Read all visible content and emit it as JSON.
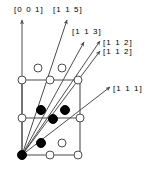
{
  "figure": {
    "type": "crystal-lattice-direction-diagram",
    "colors": {
      "line": "#4d4d4d",
      "vector": "#4d4d4d",
      "filled_atom": "#000000",
      "open_atom_fill": "#ffffff",
      "open_atom_stroke": "#4d4d4d",
      "text": "#000000",
      "background": "#ffffff"
    },
    "labels": [
      {
        "id": "dir-001",
        "text": "[0 0 1]",
        "x": 14,
        "y": 5
      },
      {
        "id": "dir-115",
        "text": "[1 1 5]",
        "x": 53,
        "y": 5
      },
      {
        "id": "dir-113",
        "text": "[1 1 3]",
        "x": 72,
        "y": 27
      },
      {
        "id": "dir-112-a",
        "text": "[1 1 2]",
        "x": 103,
        "y": 38
      },
      {
        "id": "dir-112-b",
        "text": "[1 1 2]",
        "x": 103,
        "y": 47
      },
      {
        "id": "dir-111",
        "text": "[1 1 1]",
        "x": 113,
        "y": 84
      }
    ],
    "vectors": [
      {
        "id": "v-001",
        "label": "[0 0 1]",
        "x1": 22,
        "y1": 155,
        "x2": 22,
        "y2": 20
      },
      {
        "id": "v-115",
        "label": "[1 1 5]",
        "x1": 22,
        "y1": 155,
        "x2": 67,
        "y2": 20
      },
      {
        "id": "v-113",
        "label": "[1 1 3]",
        "x1": 22,
        "y1": 155,
        "x2": 84,
        "y2": 42
      },
      {
        "id": "v-112-a",
        "label": "[1 1 2]",
        "x1": 22,
        "y1": 155,
        "x2": 100,
        "y2": 41
      },
      {
        "id": "v-112-b",
        "label": "[1 1 2]",
        "x1": 22,
        "y1": 155,
        "x2": 100,
        "y2": 51
      },
      {
        "id": "v-111",
        "label": "[1 1 1]",
        "x1": 22,
        "y1": 155,
        "x2": 110,
        "y2": 87
      }
    ],
    "cell_lines": [
      {
        "id": "edge-left",
        "x1": 22,
        "y1": 80,
        "x2": 22,
        "y2": 155
      },
      {
        "id": "edge-right",
        "x1": 80,
        "y1": 80,
        "x2": 80,
        "y2": 155
      },
      {
        "id": "edge-top",
        "x1": 22,
        "y1": 80,
        "x2": 80,
        "y2": 80
      },
      {
        "id": "edge-middle",
        "x1": 22,
        "y1": 118,
        "x2": 80,
        "y2": 118
      },
      {
        "id": "edge-bottom",
        "x1": 22,
        "y1": 155,
        "x2": 80,
        "y2": 155
      }
    ],
    "open_atoms": [
      {
        "id": "open-top-a",
        "cx": 38,
        "cy": 68,
        "r": 4
      },
      {
        "id": "open-top-b",
        "cx": 62,
        "cy": 68,
        "r": 4
      },
      {
        "id": "open-row1-l",
        "cx": 22,
        "cy": 80,
        "r": 4
      },
      {
        "id": "open-row1-m",
        "cx": 50,
        "cy": 80,
        "r": 4
      },
      {
        "id": "open-row1-r",
        "cx": 78,
        "cy": 80,
        "r": 4
      },
      {
        "id": "open-row2-l",
        "cx": 22,
        "cy": 118,
        "r": 4
      },
      {
        "id": "open-row2-r",
        "cx": 80,
        "cy": 118,
        "r": 4
      },
      {
        "id": "open-low-m",
        "cx": 62,
        "cy": 143,
        "r": 4
      },
      {
        "id": "open-row3-m",
        "cx": 50,
        "cy": 155,
        "r": 4
      },
      {
        "id": "open-row3-r",
        "cx": 78,
        "cy": 155,
        "r": 4
      }
    ],
    "filled_atoms": [
      {
        "id": "filled-upper-l",
        "cx": 41,
        "cy": 110,
        "r": 4.5
      },
      {
        "id": "filled-upper-r",
        "cx": 65,
        "cy": 110,
        "r": 4.5
      },
      {
        "id": "filled-mid",
        "cx": 53,
        "cy": 119,
        "r": 4.5
      },
      {
        "id": "filled-lower",
        "cx": 41,
        "cy": 143,
        "r": 4.5
      },
      {
        "id": "filled-origin",
        "cx": 22,
        "cy": 155,
        "r": 4.5
      }
    ]
  }
}
